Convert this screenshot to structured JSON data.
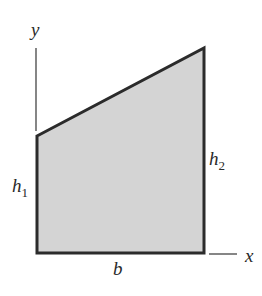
{
  "diagram": {
    "type": "trapezoid-area-figure",
    "colors": {
      "fill": "#d4d4d4",
      "stroke": "#2b2b2b",
      "axis": "#444444",
      "text": "#2a2a2a"
    },
    "labels": {
      "y_axis": "y",
      "x_axis": "x",
      "left_height": {
        "base": "h",
        "sub": "1"
      },
      "right_height": {
        "base": "h",
        "sub": "2"
      },
      "base": "b"
    }
  }
}
